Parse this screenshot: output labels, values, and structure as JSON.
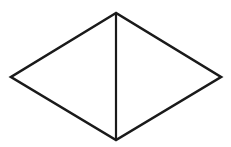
{
  "figure": {
    "name": "rhombus-with-vertical-bisector",
    "background_color": "#ffffff",
    "stroke_color": "#1a1a1a",
    "outline_stroke_width": 2.6,
    "divider_stroke_width": 2.2,
    "canvas": {
      "width": 231,
      "height": 147
    },
    "vertices": {
      "top": {
        "label": "top-vertex",
        "x": 116,
        "y": 13
      },
      "left": {
        "label": "left-vertex",
        "x": 11,
        "y": 77
      },
      "bottom": {
        "label": "bottom-vertex",
        "x": 116,
        "y": 140
      },
      "right": {
        "label": "right-vertex",
        "x": 221,
        "y": 77
      }
    },
    "outline_points": "116,13 11,77 116,140 221,77",
    "divider_line": {
      "label": "vertical-bisector",
      "x1": 116,
      "y1": 13,
      "x2": 116,
      "y2": 140
    },
    "regions": [
      {
        "label": "left-triangle",
        "points": "116,13 11,77 116,140"
      },
      {
        "label": "right-triangle",
        "points": "116,13 221,77 116,140"
      }
    ]
  }
}
